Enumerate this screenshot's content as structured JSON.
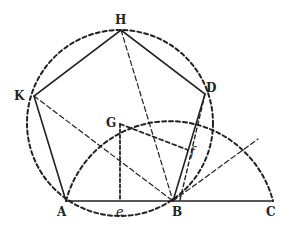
{
  "diagram": {
    "type": "geometric-construction",
    "colors": {
      "ink": "#222222",
      "background": "#ffffff"
    },
    "points": {
      "H": {
        "label": "H",
        "x": 121,
        "y": 30
      },
      "K": {
        "label": "K",
        "x": 34,
        "y": 96
      },
      "D": {
        "label": "D",
        "x": 205,
        "y": 94
      },
      "A": {
        "label": "A",
        "x": 66,
        "y": 201
      },
      "B": {
        "label": "B",
        "x": 173,
        "y": 201
      },
      "C": {
        "label": "C",
        "x": 273,
        "y": 201
      },
      "G": {
        "label": "G",
        "x": 120,
        "y": 124
      },
      "e": {
        "label": "e",
        "x": 120,
        "y": 201
      },
      "f": {
        "label": "f",
        "x": 188,
        "y": 150
      }
    },
    "solid_segments": [
      "A-K",
      "K-H",
      "H-D",
      "D-B",
      "A-C"
    ],
    "dashed_segments": [
      "K-B",
      "H-B",
      "G-e",
      "G-f",
      "B-arc"
    ],
    "circles": [
      {
        "name": "circumcircle",
        "center": "G",
        "radius": 93,
        "style": "dashed"
      },
      {
        "name": "construction-arc",
        "center": "B",
        "radius": 104,
        "from": "A",
        "to": "C",
        "style": "dashed"
      }
    ]
  }
}
